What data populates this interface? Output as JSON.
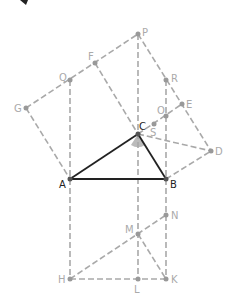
{
  "diagram": {
    "title": "",
    "main_triangle": [
      "A",
      "B",
      "C"
    ],
    "right_angle_at": "C",
    "points": {
      "A": {
        "label": "A",
        "x": 70,
        "y": 179
      },
      "B": {
        "label": "B",
        "x": 166,
        "y": 179
      },
      "C": {
        "label": "C",
        "x": 138,
        "y": 134
      },
      "P": {
        "label": "P",
        "x": 138,
        "y": 34
      },
      "F": {
        "label": "F",
        "x": 95,
        "y": 63
      },
      "Q": {
        "label": "Q",
        "x": 70,
        "y": 80
      },
      "G": {
        "label": "G",
        "x": 26,
        "y": 108
      },
      "R": {
        "label": "R",
        "x": 166,
        "y": 80
      },
      "E": {
        "label": "E",
        "x": 182,
        "y": 104
      },
      "O": {
        "label": "O",
        "x": 166,
        "y": 116
      },
      "S": {
        "label": "S",
        "x": 154,
        "y": 124
      },
      "D": {
        "label": "D",
        "x": 211,
        "y": 151
      },
      "N": {
        "label": "N",
        "x": 166,
        "y": 215
      },
      "M": {
        "label": "M",
        "x": 138,
        "y": 234
      },
      "H": {
        "label": "H",
        "x": 70,
        "y": 279
      },
      "L": {
        "label": "L",
        "x": 138,
        "y": 279
      },
      "K": {
        "label": "K",
        "x": 166,
        "y": 279
      }
    },
    "colors": {
      "solid": "#222222",
      "dashed": "#a9a9a9",
      "angle_fill": "#bbbbbb"
    }
  }
}
